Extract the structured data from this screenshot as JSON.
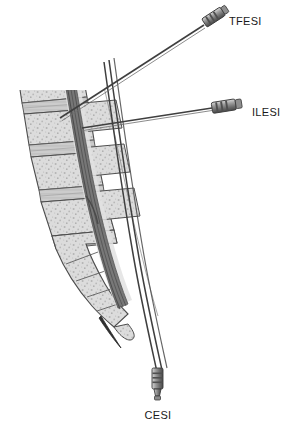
{
  "figure": {
    "background_color": "#ffffff",
    "width": 288,
    "height": 424
  },
  "labels": {
    "tfesi": "TFESI",
    "ilesi": "ILESI",
    "cesi": "CESI"
  },
  "palette": {
    "outline": "#3a3a3a",
    "bone_fill": "#d9d9d9",
    "bone_fill_light": "#e8e8e8",
    "bone_fill_fade": "#f0f0f0",
    "disc_fill": "#c9c9c9",
    "canal_dark": "#6e6e6e",
    "nerve_dark": "#585858",
    "needle_shaft": "#4a4a4a",
    "hub_light": "#c0c0c0",
    "hub_mid": "#8d8d8d",
    "hub_dark": "#5a5a5a",
    "label_text": "#1a1a1a",
    "speckle": "#b2b2b2"
  },
  "anatomy": {
    "structures": [
      {
        "name": "vertebral-body-l1",
        "kind": "vertebra",
        "fade": true
      },
      {
        "name": "vertebral-body-l2",
        "kind": "vertebra",
        "fade": false
      },
      {
        "name": "vertebral-body-l3",
        "kind": "vertebra",
        "fade": false
      },
      {
        "name": "vertebral-body-l4",
        "kind": "vertebra",
        "fade": false
      },
      {
        "name": "vertebral-body-l5",
        "kind": "vertebra",
        "fade": false
      },
      {
        "name": "sacrum",
        "kind": "sacrum",
        "fade": false
      },
      {
        "name": "coccyx",
        "kind": "coccyx",
        "fade": false
      },
      {
        "name": "intervertebral-discs",
        "kind": "disc",
        "count": 5
      },
      {
        "name": "spinal-canal",
        "kind": "canal"
      },
      {
        "name": "cauda-equina",
        "kind": "nerve-bundle"
      },
      {
        "name": "spinous-processes",
        "kind": "process"
      },
      {
        "name": "sacral-hiatus",
        "kind": "opening"
      }
    ]
  },
  "needles": [
    {
      "id": "tfesi",
      "label": "TFESI",
      "approach": "transforaminal",
      "hub_position": {
        "x": 212,
        "y": 18
      },
      "tip_position": {
        "x": 60,
        "y": 118
      },
      "label_position": {
        "x": 229,
        "y": 22
      }
    },
    {
      "id": "ilesi",
      "label": "ILESI",
      "approach": "interlaminar",
      "hub_position": {
        "x": 228,
        "y": 107
      },
      "tip_position": {
        "x": 82,
        "y": 128
      },
      "label_position": {
        "x": 252,
        "y": 112
      }
    },
    {
      "id": "cesi",
      "label": "CESI",
      "approach": "caudal",
      "hub_position": {
        "x": 158,
        "y": 385
      },
      "tip_position": {
        "x": 104,
        "y": 62
      },
      "label_position": {
        "x": 158,
        "y": 417
      }
    }
  ]
}
